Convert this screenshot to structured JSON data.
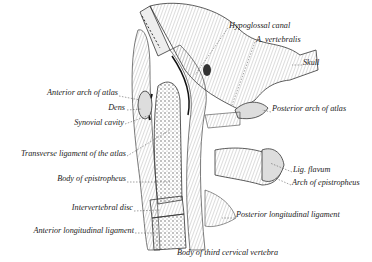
{
  "figure": {
    "labels_left": [
      {
        "id": "anterior-arch-of-atlas",
        "text": "Anterior arch of atlas",
        "x": 118,
        "y": 93
      },
      {
        "id": "dens",
        "text": "Dens",
        "x": 125,
        "y": 108
      },
      {
        "id": "synovial-cavity",
        "text": "Synovial cavity",
        "x": 124,
        "y": 122
      },
      {
        "id": "transverse-ligament",
        "text": "Transverse ligament of the atlas",
        "x": 126,
        "y": 153
      },
      {
        "id": "body-of-epistropheus",
        "text": "Body of epistropheus",
        "x": 126,
        "y": 179
      },
      {
        "id": "intervertebral-disc",
        "text": "Intervertebral disc",
        "x": 133,
        "y": 208
      },
      {
        "id": "anterior-longitudinal-ligament",
        "text": "Anterior longitudinal ligament",
        "x": 134,
        "y": 230
      }
    ],
    "labels_right": [
      {
        "id": "hypoglossal-canal",
        "text": "Hypoglossal canal",
        "x": 229,
        "y": 26
      },
      {
        "id": "a-vertebralis",
        "text": "A. vertebralis",
        "x": 256,
        "y": 40
      },
      {
        "id": "skull",
        "text": "Skull",
        "x": 303,
        "y": 63
      },
      {
        "id": "posterior-arch-of-atlas",
        "text": "Posterior arch of atlas",
        "x": 272,
        "y": 109
      },
      {
        "id": "lig-flavum",
        "text": "Lig. flavum",
        "x": 293,
        "y": 170
      },
      {
        "id": "arch-of-epistropheus",
        "text": "Arch of epistropheus",
        "x": 292,
        "y": 183
      },
      {
        "id": "posterior-longitudinal-ligament",
        "text": "Posterior longitudinal ligament",
        "x": 236,
        "y": 215
      },
      {
        "id": "body-of-third-cervical-vertebra",
        "text": "Body of third cervical vertebra",
        "x": 177,
        "y": 253
      }
    ],
    "colors": {
      "background": "#ffffff",
      "ink": "#222222",
      "bone_fill": "#e6e6e6",
      "soft_tissue": "#cfcfcf"
    }
  }
}
